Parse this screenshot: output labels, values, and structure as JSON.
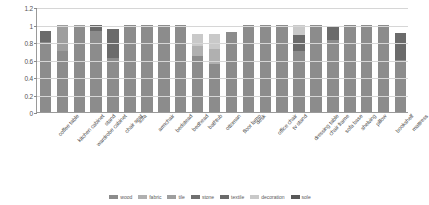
{
  "chart_data": {
    "type": "bar",
    "stacked": true,
    "title": "",
    "subtitle": "",
    "xlabel": "",
    "ylabel": "",
    "ylim": [
      0,
      1.2
    ],
    "grid": true,
    "legend_position": "bottom",
    "y_ticks": [
      "0",
      "0.2",
      "0.4",
      "0.6",
      "0.8",
      "1",
      "1.2"
    ],
    "y_tick_values": [
      0,
      0.2,
      0.4,
      0.6,
      0.8,
      1.0,
      1.2
    ],
    "categories": [
      "coffee table",
      "kitchen cabinet",
      "wardrobe cabinet",
      "stand",
      "chair seat",
      "sofa",
      "armchair",
      "bedstead",
      "bedhead",
      "bathtub",
      "ottoman",
      "floor lamp",
      "desk",
      "office chair",
      "tv stand",
      "dressing table",
      "chair frame",
      "sofa base",
      "shelving",
      "pillow",
      "bookshelf",
      "mattress"
    ],
    "series": [
      {
        "name": "wood",
        "color": "#8c8c8c",
        "texture": "tx-dots",
        "values": [
          0.8,
          0.7,
          0.97,
          0.93,
          0.62,
          0.99,
          0.99,
          1.0,
          0.99,
          0.64,
          0.55,
          0.92,
          0.99,
          1.0,
          0.99,
          0.7,
          0.99,
          0.82,
          0.99,
          0.99,
          0.99,
          0.6
        ]
      },
      {
        "name": "fabric",
        "color": "#b0b0b0",
        "texture": "tx-cross",
        "values": [
          0.0,
          0.0,
          0.0,
          0.0,
          0.0,
          0.0,
          0.0,
          0.0,
          0.0,
          0.12,
          0.17,
          0.0,
          0.0,
          0.0,
          0.0,
          0.0,
          0.0,
          0.0,
          0.0,
          0.0,
          0.0,
          0.0
        ]
      },
      {
        "name": "tile",
        "color": "#9e9e9e",
        "texture": "tx-vert",
        "values": [
          0.0,
          0.3,
          0.03,
          0.0,
          0.0,
          0.01,
          0.01,
          0.0,
          0.01,
          0.0,
          0.0,
          0.0,
          0.01,
          0.0,
          0.01,
          0.0,
          0.01,
          0.0,
          0.01,
          0.01,
          0.01,
          0.0
        ]
      },
      {
        "name": "stone",
        "color": "#707070",
        "texture": "tx-horz",
        "values": [
          0.0,
          0.0,
          0.0,
          0.0,
          0.0,
          0.0,
          0.0,
          0.0,
          0.0,
          0.0,
          0.0,
          0.0,
          0.0,
          0.0,
          0.0,
          0.0,
          0.0,
          0.0,
          0.0,
          0.0,
          0.0,
          0.0
        ]
      },
      {
        "name": "textile",
        "color": "#6b6b6b",
        "texture": "tx-solid",
        "values": [
          0.13,
          0.0,
          0.0,
          0.07,
          0.33,
          0.0,
          0.0,
          0.0,
          0.0,
          0.0,
          0.0,
          0.0,
          0.0,
          0.0,
          0.0,
          0.18,
          0.0,
          0.16,
          0.0,
          0.0,
          0.0,
          0.3
        ]
      },
      {
        "name": "decoration",
        "color": "#c9c9c9",
        "texture": "tx-diag",
        "values": [
          0.0,
          0.0,
          0.0,
          0.0,
          0.0,
          0.0,
          0.0,
          0.0,
          0.0,
          0.13,
          0.17,
          0.0,
          0.0,
          0.0,
          0.0,
          0.11,
          0.0,
          0.0,
          0.0,
          0.0,
          0.0,
          0.0
        ]
      },
      {
        "name": "sole",
        "color": "#585858",
        "texture": "tx-fine",
        "values": [
          0.0,
          0.0,
          0.0,
          0.0,
          0.0,
          0.0,
          0.0,
          0.0,
          0.0,
          0.0,
          0.0,
          0.0,
          0.0,
          0.0,
          0.0,
          0.0,
          0.0,
          0.0,
          0.0,
          0.0,
          0.0,
          0.0
        ]
      }
    ]
  }
}
